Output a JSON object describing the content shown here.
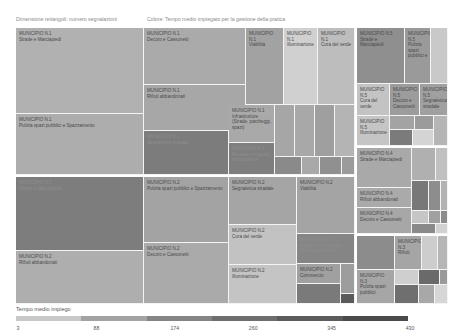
{
  "header": {
    "size_label": "Dimensione rettangoli: numero segnalazioni",
    "color_label": "Colore: Tempo medio impiegato per la gestione della pratica"
  },
  "chart_data": {
    "type": "treemap",
    "title": "",
    "size_measure": "numero segnalazioni",
    "color_measure": "Tempo medio impiegato per la gestione della pratica",
    "legend": {
      "title": "Tempo medio impiego",
      "min": 3,
      "max": 430,
      "ticks": [
        3,
        88,
        174,
        260,
        345,
        430
      ],
      "colors": [
        "#c8c8c8",
        "#a3a3a3",
        "#858585",
        "#6e6e6e",
        "#5c5c5c",
        "#4a4a4a"
      ]
    },
    "cells": [
      {
        "municipio": "MUNICIPIO N.1",
        "category": "Strade e Marciapiedi",
        "x": 16,
        "y": 28,
        "w": 128,
        "h": 86,
        "color": "#b1b1b1"
      },
      {
        "municipio": "MUNICIPIO N.1",
        "category": "Pulizia spazi pubblici e Spazzamento",
        "x": 16,
        "y": 114,
        "w": 128,
        "h": 61,
        "color": "#adadad"
      },
      {
        "municipio": "MUNICIPIO N.1",
        "category": "Decoro e Cassonetti",
        "x": 144,
        "y": 28,
        "w": 102,
        "h": 57,
        "color": "#aaaaaa"
      },
      {
        "municipio": "MUNICIPIO N.1",
        "category": "Rifiuti abbandonati",
        "x": 144,
        "y": 85,
        "w": 102,
        "h": 46,
        "color": "#a7a7a7"
      },
      {
        "municipio": "MUNICIPIO N.1",
        "category": "Segnaletica stradale",
        "x": 144,
        "y": 131,
        "w": 85,
        "h": 44,
        "color": "#7c7c7c",
        "dark": true
      },
      {
        "municipio": "MUNICIPIO N.1",
        "category": "Viabilità",
        "x": 246,
        "y": 28,
        "w": 38,
        "h": 77,
        "color": "#a2a2a2"
      },
      {
        "municipio": "MUNICIPIO N.1",
        "category": "Illuminazione",
        "x": 284,
        "y": 28,
        "w": 34,
        "h": 77,
        "color": "#d0d0d0"
      },
      {
        "municipio": "MUNICIPIO N.1",
        "category": "Cura del verde",
        "x": 318,
        "y": 28,
        "w": 37,
        "h": 77,
        "color": "#bdbdbd"
      },
      {
        "municipio": "MUNICIPIO N.1",
        "category": "Infrastrutture (Strade, parcheggi, spazi)",
        "x": 229,
        "y": 105,
        "w": 46,
        "h": 38,
        "color": "#a9a9a9"
      },
      {
        "municipio": "MUNICIPIO N.1",
        "category": "Fontane e impianti di irrigazione",
        "x": 229,
        "y": 143,
        "w": 46,
        "h": 32,
        "color": "#7e7e7e",
        "dark": true
      },
      {
        "municipio": "",
        "category": "",
        "x": 275,
        "y": 105,
        "w": 20,
        "h": 52,
        "color": "#a6a6a6"
      },
      {
        "municipio": "",
        "category": "",
        "x": 295,
        "y": 105,
        "w": 20,
        "h": 52,
        "color": "#a8a8a8"
      },
      {
        "municipio": "",
        "category": "",
        "x": 315,
        "y": 105,
        "w": 20,
        "h": 52,
        "color": "#9f9f9f"
      },
      {
        "municipio": "",
        "category": "",
        "x": 335,
        "y": 105,
        "w": 20,
        "h": 52,
        "color": "#b4b4b4"
      },
      {
        "municipio": "",
        "category": "",
        "x": 275,
        "y": 157,
        "w": 27,
        "h": 18,
        "color": "#8a8a8a"
      },
      {
        "municipio": "",
        "category": "",
        "x": 302,
        "y": 157,
        "w": 18,
        "h": 18,
        "color": "#a9a9a9"
      },
      {
        "municipio": "",
        "category": "",
        "x": 320,
        "y": 157,
        "w": 22,
        "h": 18,
        "color": "#909090"
      },
      {
        "municipio": "",
        "category": "",
        "x": 342,
        "y": 157,
        "w": 13,
        "h": 18,
        "color": "#9b9b9b"
      },
      {
        "municipio": "MUNICIPIO N.5",
        "category": "Strade e Marciapiedi",
        "x": 357,
        "y": 28,
        "w": 48,
        "h": 56,
        "color": "#8f8f8f"
      },
      {
        "municipio": "MUNICIPIO N.5",
        "category": "Pulizia spazi pubblici e",
        "x": 405,
        "y": 28,
        "w": 26,
        "h": 56,
        "color": "#9a9a9a"
      },
      {
        "municipio": "",
        "category": "",
        "x": 431,
        "y": 28,
        "w": 17,
        "h": 56,
        "color": "#c9c9c9"
      },
      {
        "municipio": "MUNICIPIO N.5",
        "category": "Cura del verde",
        "x": 357,
        "y": 84,
        "w": 33,
        "h": 32,
        "color": "#c3c3c3"
      },
      {
        "municipio": "MUNICIPIO N.5",
        "category": "Decoro e Cassonetti",
        "x": 390,
        "y": 84,
        "w": 30,
        "h": 32,
        "color": "#9c9c9c"
      },
      {
        "municipio": "MUNICIPIO N.5",
        "category": "Segnaletica stradale",
        "x": 420,
        "y": 84,
        "w": 28,
        "h": 32,
        "color": "#a0a0a0"
      },
      {
        "municipio": "MUNICIPIO N.5",
        "category": "Illuminazione",
        "x": 357,
        "y": 116,
        "w": 33,
        "h": 30,
        "color": "#c5c5c5"
      },
      {
        "municipio": "",
        "category": "",
        "x": 390,
        "y": 116,
        "w": 25,
        "h": 14,
        "color": "#a3a3a3"
      },
      {
        "municipio": "",
        "category": "",
        "x": 415,
        "y": 116,
        "w": 19,
        "h": 14,
        "color": "#9b9b9b"
      },
      {
        "municipio": "",
        "category": "",
        "x": 434,
        "y": 116,
        "w": 14,
        "h": 30,
        "color": "#b5b5b5"
      },
      {
        "municipio": "",
        "category": "",
        "x": 390,
        "y": 130,
        "w": 23,
        "h": 16,
        "color": "#7b7b7b"
      },
      {
        "municipio": "",
        "category": "",
        "x": 413,
        "y": 130,
        "w": 21,
        "h": 16,
        "color": "#d4d4d4"
      },
      {
        "municipio": "MUNICIPIO N.2",
        "category": "Strade e Marciapiedi",
        "x": 16,
        "y": 177,
        "w": 128,
        "h": 74,
        "color": "#7d7d7d",
        "dark": true
      },
      {
        "municipio": "MUNICIPIO N.2",
        "category": "Rifiuti abbandonati",
        "x": 16,
        "y": 251,
        "w": 128,
        "h": 53,
        "color": "#aeaeae"
      },
      {
        "municipio": "MUNICIPIO N.2",
        "category": "Pulizia spazi pubblici e Spazzamento",
        "x": 144,
        "y": 177,
        "w": 85,
        "h": 66,
        "color": "#a3a3a3"
      },
      {
        "municipio": "MUNICIPIO N.2",
        "category": "Decoro e Cassonetti",
        "x": 144,
        "y": 243,
        "w": 85,
        "h": 61,
        "color": "#aaaaaa"
      },
      {
        "municipio": "MUNICIPIO N.2",
        "category": "Segnaletica stradale",
        "x": 229,
        "y": 177,
        "w": 68,
        "h": 48,
        "color": "#a5a5a5"
      },
      {
        "municipio": "MUNICIPIO N.2",
        "category": "Cura del verde",
        "x": 229,
        "y": 225,
        "w": 68,
        "h": 40,
        "color": "#c2c2c2"
      },
      {
        "municipio": "MUNICIPIO N.2",
        "category": "Illuminazione",
        "x": 229,
        "y": 265,
        "w": 68,
        "h": 39,
        "color": "#c4c4c4"
      },
      {
        "municipio": "MUNICIPIO N.2",
        "category": "Viabilità",
        "x": 297,
        "y": 177,
        "w": 58,
        "h": 57,
        "color": "#a4a4a4"
      },
      {
        "municipio": "MUNICIPIO N.2",
        "category": "Infrastrutture (Strade, parcheggi, spazi)",
        "x": 297,
        "y": 234,
        "w": 58,
        "h": 30,
        "color": "#858585",
        "dark": true
      },
      {
        "municipio": "MUNICIPIO N.2",
        "category": "Commercio",
        "x": 297,
        "y": 264,
        "w": 44,
        "h": 20,
        "color": "#a0a0a0"
      },
      {
        "municipio": "",
        "category": "",
        "x": 297,
        "y": 284,
        "w": 44,
        "h": 20,
        "color": "#7a7a7a"
      },
      {
        "municipio": "",
        "category": "",
        "x": 341,
        "y": 264,
        "w": 14,
        "h": 30,
        "color": "#9d9d9d"
      },
      {
        "municipio": "",
        "category": "",
        "x": 341,
        "y": 294,
        "w": 14,
        "h": 10,
        "color": "#5a5a5a"
      },
      {
        "municipio": "MUNICIPIO N.4",
        "category": "Strade e Marciapiedi",
        "x": 357,
        "y": 148,
        "w": 55,
        "h": 40,
        "color": "#a9a9a9"
      },
      {
        "municipio": "MUNICIPIO N.4",
        "category": "Rifiuti abbandonati",
        "x": 357,
        "y": 188,
        "w": 55,
        "h": 20,
        "color": "#aaaaaa"
      },
      {
        "municipio": "MUNICIPIO N.4",
        "category": "Decoro e Cassonetti",
        "x": 357,
        "y": 208,
        "w": 55,
        "h": 26,
        "color": "#a7a7a7"
      },
      {
        "municipio": "",
        "category": "",
        "x": 412,
        "y": 148,
        "w": 24,
        "h": 33,
        "color": "#b0b0b0"
      },
      {
        "municipio": "",
        "category": "",
        "x": 436,
        "y": 148,
        "w": 12,
        "h": 33,
        "color": "#c0c0c0"
      },
      {
        "municipio": "",
        "category": "",
        "x": 412,
        "y": 181,
        "w": 17,
        "h": 30,
        "color": "#787878"
      },
      {
        "municipio": "",
        "category": "",
        "x": 429,
        "y": 181,
        "w": 12,
        "h": 30,
        "color": "#8d8d8d"
      },
      {
        "municipio": "",
        "category": "",
        "x": 441,
        "y": 181,
        "w": 7,
        "h": 30,
        "color": "#b2b2b2"
      },
      {
        "municipio": "",
        "category": "",
        "x": 412,
        "y": 211,
        "w": 17,
        "h": 13,
        "color": "#c6c6c6"
      },
      {
        "municipio": "",
        "category": "",
        "x": 429,
        "y": 211,
        "w": 12,
        "h": 13,
        "color": "#a0a0a0"
      },
      {
        "municipio": "",
        "category": "",
        "x": 441,
        "y": 211,
        "w": 7,
        "h": 13,
        "color": "#8c8c8c"
      },
      {
        "municipio": "",
        "category": "",
        "x": 412,
        "y": 224,
        "w": 24,
        "h": 10,
        "color": "#8a8a8a"
      },
      {
        "municipio": "",
        "category": "",
        "x": 436,
        "y": 224,
        "w": 12,
        "h": 10,
        "color": "#d2d2d2"
      },
      {
        "municipio": "MUNICIPIO N.3",
        "category": "Strade e Marciapiedi",
        "x": 357,
        "y": 236,
        "w": 38,
        "h": 34,
        "color": "#8c8c8c",
        "dark": true
      },
      {
        "municipio": "MUNICIPIO N.3",
        "category": "Rifiuti",
        "x": 395,
        "y": 236,
        "w": 27,
        "h": 34,
        "color": "#a5a5a5"
      },
      {
        "municipio": "",
        "category": "",
        "x": 422,
        "y": 236,
        "w": 16,
        "h": 34,
        "color": "#cdcdcd"
      },
      {
        "municipio": "",
        "category": "",
        "x": 438,
        "y": 236,
        "w": 10,
        "h": 34,
        "color": "#b6b6b6"
      },
      {
        "municipio": "MUNICIPIO N.3",
        "category": "Pulizia spazi pubblici",
        "x": 357,
        "y": 270,
        "w": 38,
        "h": 34,
        "color": "#a6a6a6"
      },
      {
        "municipio": "",
        "category": "",
        "x": 395,
        "y": 270,
        "w": 24,
        "h": 15,
        "color": "#cfcfcf"
      },
      {
        "municipio": "",
        "category": "",
        "x": 419,
        "y": 270,
        "w": 21,
        "h": 15,
        "color": "#6a6a6a"
      },
      {
        "municipio": "",
        "category": "",
        "x": 440,
        "y": 270,
        "w": 8,
        "h": 15,
        "color": "#9a9a9a"
      },
      {
        "municipio": "",
        "category": "",
        "x": 395,
        "y": 285,
        "w": 24,
        "h": 19,
        "color": "#6f6f6f"
      },
      {
        "municipio": "",
        "category": "",
        "x": 419,
        "y": 285,
        "w": 16,
        "h": 19,
        "color": "#a8a8a8"
      },
      {
        "municipio": "",
        "category": "",
        "x": 435,
        "y": 285,
        "w": 13,
        "h": 19,
        "color": "#d6d6d6"
      }
    ]
  }
}
